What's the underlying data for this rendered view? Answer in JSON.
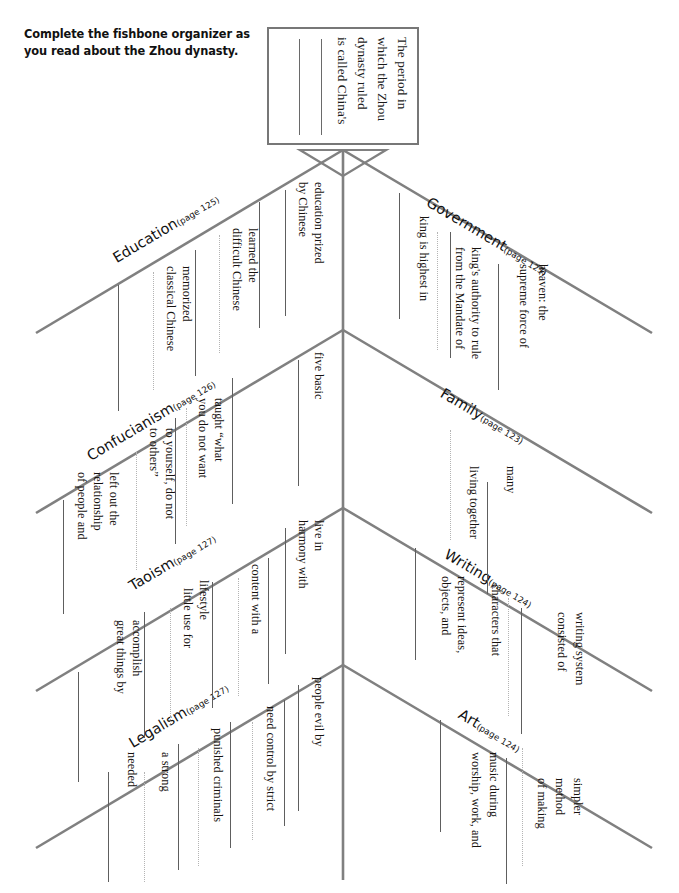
{
  "instruction": "Complete the fishbone organizer as you read about the Zhou dynasty.",
  "head": {
    "line1": "The period in",
    "line2": "which the Zhou",
    "line3": "dynasty ruled",
    "line4": "is called China's"
  },
  "spine_items": [
    "education prized by Chinese",
    "five basic",
    "live in harmony with",
    "people evil by"
  ],
  "spine_items_split": [
    [
      "education prized",
      "by Chinese"
    ],
    [
      "five basic"
    ],
    [
      "live in",
      "harmony with"
    ],
    [
      "people evil by"
    ]
  ],
  "branches": [
    {
      "name": "Education",
      "page": "(page 125)",
      "side": "left",
      "items": [
        [
          "learned the",
          "difficult Chinese"
        ],
        [
          "memorized",
          "classical Chinese"
        ]
      ]
    },
    {
      "name": "Government",
      "page": "(page 123)",
      "side": "right",
      "items": [
        [
          "king is highest in"
        ],
        [
          "king's authority to rule",
          "from the Mandate of"
        ],
        [
          "heaven: the",
          "supreme force of"
        ]
      ]
    },
    {
      "name": "Confucianism",
      "page": "(page 126)",
      "side": "left",
      "items": [
        [
          "taught “what",
          "you do not want"
        ],
        [
          "to yourself, do not",
          "to others”"
        ],
        [
          "left out the",
          "relationship",
          "of people and"
        ]
      ]
    },
    {
      "name": "Family",
      "page": "(page 123)",
      "side": "right",
      "items": [
        [
          "many"
        ],
        [
          "living together"
        ]
      ]
    },
    {
      "name": "Taoism",
      "page": "(page 127)",
      "side": "left",
      "items": [
        [
          "content with a"
        ],
        [
          "little use for",
          "lifestyle"
        ],
        [
          "accomplish",
          "great things by"
        ]
      ]
    },
    {
      "name": "Writing",
      "page": "(page 124)",
      "side": "right",
      "items": [
        [
          "writing system",
          "consisted of"
        ],
        [
          "characters that",
          "represent ideas,",
          "objects, and"
        ]
      ]
    },
    {
      "name": "Legalism",
      "page": "(page 127)",
      "side": "left",
      "items": [
        [
          "need control by strict"
        ],
        [
          "punished criminals"
        ],
        [
          "a strong",
          "needed"
        ]
      ]
    },
    {
      "name": "Art",
      "page": "(page 124)",
      "side": "right",
      "items": [
        [
          "simpler",
          "method",
          "of making"
        ],
        [
          "music during",
          "worship, work, and"
        ]
      ]
    }
  ],
  "colors": {
    "bone": "#808080",
    "box_border": "#777777",
    "rule": "#5e5e5e",
    "rule_dotted": "#b4b4b4",
    "text": "#16120f"
  }
}
